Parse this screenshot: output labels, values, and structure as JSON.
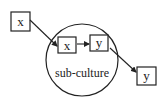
{
  "diagram": {
    "nodes": {
      "outer_x": {
        "label": "x"
      },
      "inner_x": {
        "label": "x"
      },
      "inner_y": {
        "label": "y"
      },
      "outer_y": {
        "label": "y"
      }
    },
    "group": {
      "label": "sub-culture"
    },
    "edges": [
      {
        "from": "outer_x",
        "to": "inner_x"
      },
      {
        "from": "inner_x",
        "to": "inner_y"
      },
      {
        "from": "inner_y",
        "to": "outer_y"
      }
    ],
    "colors": {
      "stroke": "#222222",
      "background": "#ffffff"
    }
  }
}
